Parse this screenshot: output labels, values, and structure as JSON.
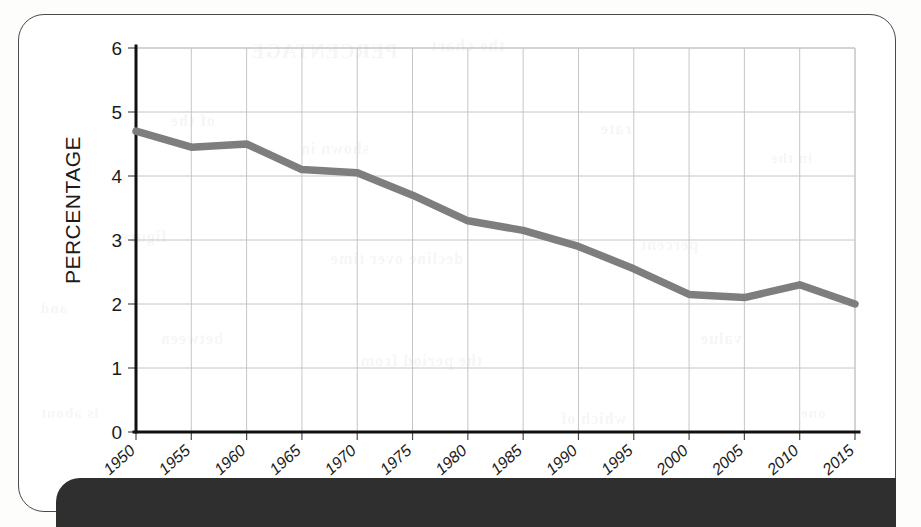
{
  "page": {
    "background_color": "#ffffff",
    "frame_color": "#4a4a4a",
    "footer_bar_color": "#2f2f2f"
  },
  "ghost_text": [
    {
      "text": "PERCENTAGE",
      "x": 250,
      "y": 40,
      "size": 20
    },
    {
      "text": "the chart",
      "x": 430,
      "y": 36,
      "size": 17
    },
    {
      "text": "of the",
      "x": 170,
      "y": 112,
      "size": 16
    },
    {
      "text": "shown in",
      "x": 300,
      "y": 140,
      "size": 16
    },
    {
      "text": "rate",
      "x": 600,
      "y": 120,
      "size": 16
    },
    {
      "text": "in the",
      "x": 770,
      "y": 150,
      "size": 15
    },
    {
      "text": "figure",
      "x": 120,
      "y": 228,
      "size": 16
    },
    {
      "text": "decline over time",
      "x": 330,
      "y": 250,
      "size": 16
    },
    {
      "text": "percent",
      "x": 640,
      "y": 236,
      "size": 16
    },
    {
      "text": "and",
      "x": 40,
      "y": 300,
      "size": 15
    },
    {
      "text": "between",
      "x": 160,
      "y": 330,
      "size": 16
    },
    {
      "text": "the period from",
      "x": 360,
      "y": 352,
      "size": 16
    },
    {
      "text": "value",
      "x": 700,
      "y": 330,
      "size": 16
    },
    {
      "text": "is about",
      "x": 40,
      "y": 405,
      "size": 15
    },
    {
      "text": "which of",
      "x": 560,
      "y": 410,
      "size": 16
    },
    {
      "text": "one",
      "x": 800,
      "y": 405,
      "size": 15
    }
  ],
  "chart_data": {
    "type": "line",
    "title": "",
    "subtitle": "",
    "xlabel": "",
    "ylabel": "PERCENTAGE",
    "xlim": [
      1950,
      2015
    ],
    "ylim": [
      0,
      6
    ],
    "grid": true,
    "legend": false,
    "line_color": "#7e7e7e",
    "gridline_color": "#c3c6c8",
    "axis_color": "#111111",
    "x_tick_labels": [
      "1950",
      "1955",
      "1960",
      "1965",
      "1970",
      "1975",
      "1980",
      "1985",
      "1990",
      "1995",
      "2000",
      "2005",
      "2010",
      "2015"
    ],
    "y_tick_labels": [
      "0",
      "1",
      "2",
      "3",
      "4",
      "5",
      "6"
    ],
    "y_ticks": [
      0,
      1,
      2,
      3,
      4,
      5,
      6
    ],
    "x": [
      1950,
      1955,
      1960,
      1965,
      1970,
      1975,
      1980,
      1985,
      1990,
      1995,
      2000,
      2005,
      2010,
      2015
    ],
    "values": [
      4.7,
      4.45,
      4.5,
      4.1,
      4.05,
      3.7,
      3.3,
      3.15,
      2.9,
      2.55,
      2.15,
      2.1,
      2.3,
      2.0
    ],
    "series": [
      {
        "name": "percentage",
        "values": [
          4.7,
          4.45,
          4.5,
          4.1,
          4.05,
          3.7,
          3.3,
          3.15,
          2.9,
          2.55,
          2.15,
          2.1,
          2.3,
          2.0
        ]
      }
    ]
  }
}
